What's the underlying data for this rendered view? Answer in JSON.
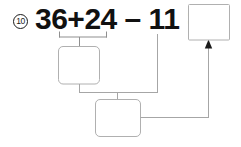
{
  "worksheet": {
    "problem_number": "10",
    "equation": "36+24 – 11 =",
    "equation_terms": [
      "36",
      "+",
      "24",
      "–",
      "11",
      "="
    ],
    "answer_boxes": [
      {
        "name": "partial-sum-box",
        "value": ""
      },
      {
        "name": "intermediate-result-box",
        "value": ""
      },
      {
        "name": "final-answer-box",
        "value": ""
      }
    ],
    "colors": {
      "text": "#111111",
      "box_border": "#b3b3b3",
      "box_fill": "#ffffff",
      "connector": "#a6a6a6",
      "arrow": "#1a1a1a",
      "background": "#ffffff"
    }
  }
}
